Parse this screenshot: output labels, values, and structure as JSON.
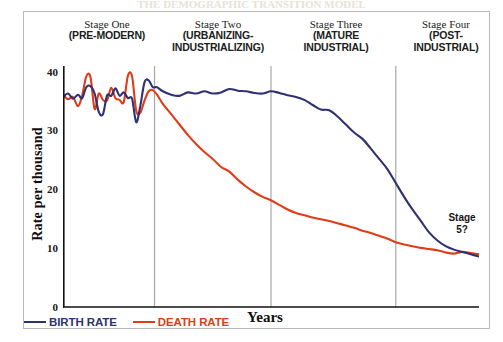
{
  "figure": {
    "cropped_title": "THE DEMOGRAPHIC TRANSITION MODEL",
    "stage5_note_line1": "Stage",
    "stage5_note_line2": "5?"
  },
  "stages": [
    {
      "name": "Stage One",
      "descriptor": "(PRE-MODERN)"
    },
    {
      "name": "Stage Two",
      "descriptor": "(URBANIZING-INDUSTRIALIZING)"
    },
    {
      "name": "Stage Three",
      "descriptor": "(MATURE INDUSTRIAL)"
    },
    {
      "name": "Stage Four",
      "descriptor": "(POST-INDUSTRIAL)"
    }
  ],
  "axes": {
    "ylabel": "Rate per thousand",
    "xlabel": "Years",
    "yticks": [
      "40",
      "30",
      "20",
      "10",
      "0"
    ]
  },
  "legend": {
    "birth_label": "BIRTH RATE",
    "death_label": "DEATH RATE"
  },
  "colors": {
    "birth": "#2e3270",
    "death": "#e03c18",
    "divider": "#a8a8a8",
    "axis": "#111111",
    "frame": "#b9b9bb"
  },
  "chart_data": {
    "type": "line",
    "title": "THE DEMOGRAPHIC TRANSITION MODEL",
    "xlabel": "Years",
    "ylabel": "Rate per thousand",
    "xlim": [
      0,
      100
    ],
    "ylim": [
      0,
      42
    ],
    "yticks": [
      0,
      10,
      20,
      30,
      40
    ],
    "grid": false,
    "legend_position": "bottom-left",
    "stage_dividers_x": [
      22,
      50,
      80
    ],
    "annotations": [
      {
        "text": "Stage 5?",
        "x": 93,
        "y": 15
      }
    ],
    "series": [
      {
        "name": "BIRTH RATE",
        "color": "#2e3270",
        "x": [
          0,
          1.2,
          2.4,
          3.6,
          4.6,
          5.6,
          6.6,
          7.6,
          8.6,
          9.6,
          10.6,
          11.6,
          12.6,
          13.6,
          14.6,
          15.6,
          16.6,
          17.6,
          18.6,
          19.6,
          20.6,
          21.6,
          22.6,
          24,
          26,
          28,
          30,
          32,
          34,
          36,
          38,
          40,
          42,
          44,
          46,
          48,
          50,
          52,
          54,
          56,
          58,
          60,
          62,
          64,
          66,
          68,
          70,
          72,
          74,
          76,
          78,
          80,
          82,
          84,
          86,
          88,
          90,
          92,
          94,
          96,
          98,
          100
        ],
        "y": [
          36.6,
          37.2,
          36.3,
          37.0,
          36.4,
          38.3,
          38.5,
          37.2,
          34.0,
          33.6,
          36.9,
          36.8,
          38.1,
          36.8,
          37.4,
          36.4,
          36.3,
          32.2,
          35.1,
          39.2,
          39.5,
          38.3,
          38.3,
          37.6,
          37.0,
          36.8,
          37.4,
          37.2,
          37.6,
          37.2,
          37.4,
          38.0,
          37.7,
          37.6,
          37.3,
          37.2,
          37.6,
          37.3,
          36.9,
          36.6,
          36.1,
          35.2,
          34.4,
          34.3,
          33.2,
          31.8,
          30.4,
          29.3,
          27.6,
          25.8,
          24.0,
          21.6,
          19.2,
          17.0,
          15.0,
          13.0,
          11.6,
          10.6,
          10.0,
          9.6,
          9.2,
          8.8
        ],
        "y_units": "per thousand"
      },
      {
        "name": "DEATH RATE",
        "color": "#e03c18",
        "x": [
          0,
          1.2,
          2.4,
          3.6,
          4.6,
          5.6,
          6.6,
          7.6,
          8.6,
          9.6,
          10.6,
          11.6,
          12.6,
          13.6,
          14.6,
          15.6,
          16.6,
          17.6,
          18.6,
          19.6,
          20.6,
          21.6,
          22.6,
          24,
          26,
          28,
          30,
          32,
          34,
          36,
          38,
          40,
          42,
          44,
          46,
          48,
          50,
          52,
          54,
          56,
          58,
          60,
          62,
          64,
          66,
          68,
          70,
          72,
          74,
          76,
          78,
          80,
          82,
          84,
          86,
          88,
          90,
          92,
          94,
          96,
          98,
          100
        ],
        "y": [
          37.0,
          36.2,
          36.6,
          35.0,
          36.8,
          40.2,
          40.1,
          34.5,
          37.2,
          36.1,
          36.0,
          38.2,
          36.4,
          36.1,
          35.7,
          40.3,
          40.2,
          34.2,
          33.9,
          36.0,
          37.6,
          37.8,
          37.0,
          35.4,
          33.6,
          31.8,
          30.0,
          28.4,
          27.0,
          25.8,
          24.4,
          23.6,
          22.2,
          21.0,
          20.0,
          19.2,
          18.6,
          17.8,
          17.0,
          16.4,
          16.0,
          15.6,
          15.3,
          15.0,
          14.6,
          14.2,
          13.8,
          13.3,
          12.9,
          12.4,
          11.9,
          11.3,
          10.9,
          10.6,
          10.3,
          10.1,
          9.9,
          9.5,
          9.3,
          9.6,
          9.4,
          9.2
        ],
        "y_units": "per thousand"
      }
    ]
  }
}
